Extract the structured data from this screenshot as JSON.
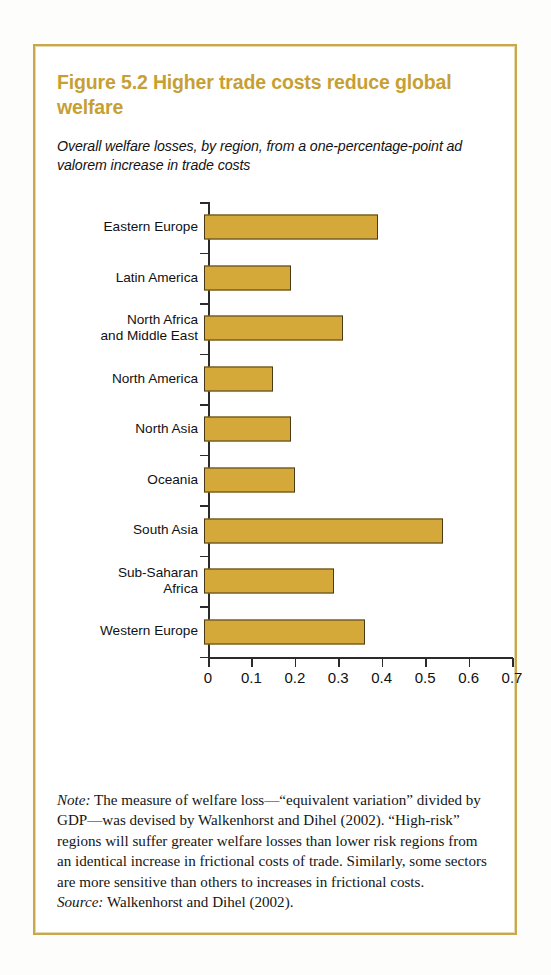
{
  "figure": {
    "title": "Figure 5.2  Higher trade costs reduce global welfare",
    "subtitle": "Overall welfare losses, by region, from a one-percentage-point ad valorem increase in trade costs",
    "note_label": "Note:",
    "note_text": " The measure of welfare loss—“equivalent variation” divided by GDP—was devised by Walkenhorst and Dihel (2002). “High-risk” regions will suffer greater welfare losses than lower risk regions from an identical increase in frictional costs of trade. Similarly, some sectors are more sensitive than others to increases in frictional costs.",
    "source_label": "Source:",
    "source_text": " Walkenhorst and Dihel (2002).",
    "colors": {
      "title": "#c79f33",
      "bar_fill": "#d4a93a",
      "bar_outline": "#4a3a18",
      "frame": "#c8a84b",
      "axis": "#2b2b2b"
    }
  },
  "chart_data": {
    "type": "bar",
    "orientation": "horizontal",
    "title": "Figure 5.2  Higher trade costs reduce global welfare",
    "subtitle": "Overall welfare losses, by region, from a one-percentage-point ad valorem increase in trade costs",
    "xlabel": "",
    "ylabel": "",
    "xlim": [
      0,
      0.7
    ],
    "xticks": [
      0,
      0.1,
      0.2,
      0.3,
      0.4,
      0.5,
      0.6,
      0.7
    ],
    "xtick_labels": [
      "0",
      "0.1",
      "0.2",
      "0.3",
      "0.4",
      "0.5",
      "0.6",
      "0.7"
    ],
    "grid": false,
    "legend": false,
    "categories": [
      "Eastern Europe",
      "Latin America",
      "North Africa\nand Middle East",
      "North America",
      "North Asia",
      "Oceania",
      "South Asia",
      "Sub-Saharan\nAfrica",
      "Western Europe"
    ],
    "values": [
      0.4,
      0.2,
      0.32,
      0.16,
      0.2,
      0.21,
      0.55,
      0.3,
      0.37
    ]
  }
}
